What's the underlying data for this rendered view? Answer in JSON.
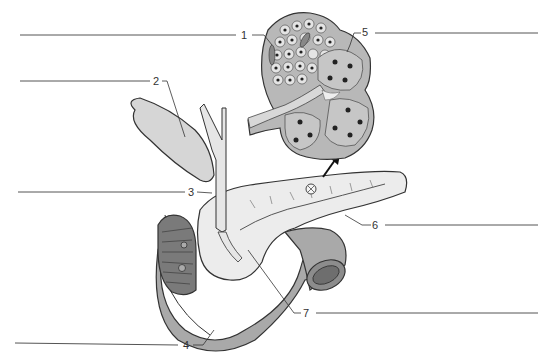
{
  "diagram": {
    "labels": [
      {
        "id": 1,
        "text": "1",
        "points_to": "pancreatic islet cells"
      },
      {
        "id": 2,
        "text": "2",
        "points_to": "gallbladder"
      },
      {
        "id": 3,
        "text": "3",
        "points_to": "common bile duct"
      },
      {
        "id": 4,
        "text": "4",
        "points_to": "duodenum"
      },
      {
        "id": 5,
        "text": "5",
        "points_to": "acinar cells"
      },
      {
        "id": 6,
        "text": "6",
        "points_to": "pancreas"
      },
      {
        "id": 7,
        "text": "7",
        "points_to": "pancreatic duct"
      }
    ],
    "answer_lines": [
      {
        "label": 1,
        "side": "left",
        "value": ""
      },
      {
        "label": 2,
        "side": "left",
        "value": ""
      },
      {
        "label": 3,
        "side": "left",
        "value": ""
      },
      {
        "label": 4,
        "side": "left",
        "value": ""
      },
      {
        "label": 5,
        "side": "right",
        "value": ""
      },
      {
        "label": 6,
        "side": "right",
        "value": ""
      },
      {
        "label": 7,
        "side": "right",
        "value": ""
      }
    ]
  },
  "colors": {
    "gallbladder": "#d6d6d6",
    "pancreas": "#ececec",
    "duodenum": "#a9a9a9",
    "duct": "#e6e6e6",
    "inset_bg": "#b8b8b8",
    "cell_fill": "#e4e4e4",
    "line": "#444444"
  }
}
